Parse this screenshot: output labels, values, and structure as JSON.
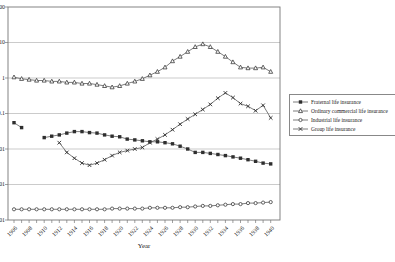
{
  "chart": {
    "x_axis_title": "Year",
    "y_tick_labels": [
      "100",
      "10",
      "1",
      "0.1",
      "0.01",
      "0.001",
      "0.0001"
    ],
    "x_tick_labels": [
      "1906",
      "1908",
      "1910",
      "1912",
      "1914",
      "1916",
      "1918",
      "1920",
      "1922",
      "1924",
      "1926",
      "1928",
      "1930",
      "1932",
      "1934",
      "1936",
      "1938",
      "1940"
    ],
    "legend": [
      "Fraternal life insurance",
      "Ordinary commercial life insurance",
      "Industrial life insurance",
      "Group life insurance"
    ],
    "colors": {
      "line": "#5a5a5a",
      "marker": "#2e2e2e",
      "grid": "#a8a8a8"
    }
  },
  "chart_data": {
    "type": "line",
    "title": "",
    "xlabel": "Year",
    "ylabel": "",
    "yscale": "log",
    "ylim": [
      0.0001,
      100
    ],
    "grid": "horizontal",
    "legend_position": "right",
    "x": [
      1906,
      1907,
      1908,
      1909,
      1910,
      1911,
      1912,
      1913,
      1914,
      1915,
      1916,
      1917,
      1918,
      1919,
      1920,
      1921,
      1922,
      1923,
      1924,
      1925,
      1926,
      1927,
      1928,
      1929,
      1930,
      1931,
      1932,
      1933,
      1934,
      1935,
      1936,
      1937,
      1938,
      1939,
      1940
    ],
    "series": [
      {
        "name": "Fraternal life insurance",
        "marker": "square",
        "values": [
          0.055,
          0.04,
          null,
          null,
          0.021,
          0.023,
          0.025,
          0.028,
          0.031,
          0.031,
          0.029,
          0.028,
          0.025,
          0.023,
          0.022,
          0.019,
          0.018,
          0.017,
          0.016,
          0.016,
          0.015,
          0.014,
          0.012,
          0.01,
          0.008,
          0.008,
          0.0075,
          0.007,
          0.0065,
          0.006,
          0.0055,
          0.005,
          0.0045,
          0.004,
          0.0038
        ]
      },
      {
        "name": "Ordinary commercial life insurance",
        "marker": "triangle",
        "values": [
          1.05,
          0.95,
          0.9,
          0.85,
          0.85,
          0.8,
          0.8,
          0.75,
          0.75,
          0.7,
          0.7,
          0.65,
          0.6,
          0.55,
          0.6,
          0.7,
          0.8,
          0.95,
          1.2,
          1.5,
          2.0,
          3.0,
          4.0,
          5.5,
          7.5,
          9.0,
          7.5,
          5.5,
          4.0,
          2.8,
          2.0,
          1.9,
          1.9,
          2.0,
          1.5
        ]
      },
      {
        "name": "Industrial life insurance",
        "marker": "circle",
        "values": [
          0.0002,
          0.0002,
          0.0002,
          0.0002,
          0.0002,
          0.0002,
          0.0002,
          0.0002,
          0.0002,
          0.0002,
          0.0002,
          0.0002,
          0.0002,
          0.00021,
          0.00021,
          0.00021,
          0.00021,
          0.00021,
          0.00022,
          0.00022,
          0.00022,
          0.00022,
          0.00023,
          0.00023,
          0.00024,
          0.00025,
          0.00025,
          0.00026,
          0.00027,
          0.00028,
          0.00028,
          0.0003,
          0.0003,
          0.00031,
          0.00032
        ]
      },
      {
        "name": "Group life insurance",
        "marker": "x",
        "values": [
          null,
          null,
          null,
          null,
          null,
          null,
          0.015,
          0.008,
          0.0055,
          0.004,
          0.0035,
          0.004,
          0.005,
          0.0065,
          0.008,
          0.009,
          0.01,
          0.011,
          0.015,
          0.019,
          0.025,
          0.035,
          0.05,
          0.07,
          0.095,
          0.13,
          0.18,
          0.27,
          0.38,
          0.28,
          0.19,
          0.16,
          0.12,
          0.17,
          0.075
        ]
      }
    ]
  }
}
